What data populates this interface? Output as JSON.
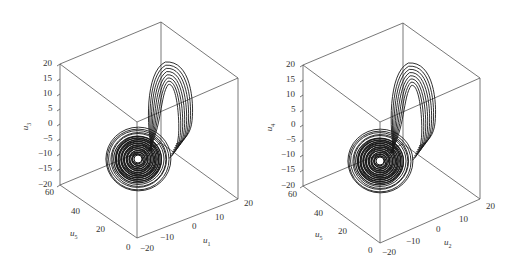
{
  "chart_data": [
    {
      "type": "scatter",
      "subtype": "3d-phase-trajectory",
      "title": "",
      "axes": {
        "x": {
          "label": "u1",
          "ticks": [
            "-20",
            "-10",
            "0",
            "10",
            "20"
          ],
          "range": [
            -20,
            20
          ]
        },
        "y": {
          "label": "u5",
          "ticks": [
            "0",
            "20",
            "40",
            "60"
          ],
          "range": [
            0,
            60
          ]
        },
        "z": {
          "label": "u3",
          "ticks": [
            "-20",
            "-15",
            "-10",
            "-5",
            "0",
            "5",
            "10",
            "15",
            "20"
          ],
          "range": [
            -20,
            20
          ]
        }
      },
      "grid": false,
      "box": true,
      "description": "Chaotic attractor: dense spiral lobe near (u1≈-20 side, u3≈-10) and a loop lobe rising to u3≈15"
    },
    {
      "type": "scatter",
      "subtype": "3d-phase-trajectory",
      "title": "",
      "axes": {
        "x": {
          "label": "u2",
          "ticks": [
            "-20",
            "-10",
            "0",
            "10",
            "20"
          ],
          "range": [
            -20,
            20
          ]
        },
        "y": {
          "label": "u5",
          "ticks": [
            "0",
            "20",
            "40",
            "60"
          ],
          "range": [
            0,
            60
          ]
        },
        "z": {
          "label": "u4",
          "ticks": [
            "-20",
            "-15",
            "-10",
            "-5",
            "0",
            "5",
            "10",
            "15",
            "20"
          ],
          "range": [
            -20,
            20
          ]
        }
      },
      "grid": false,
      "box": true,
      "description": "Chaotic attractor: dense spiral lobe and a loop lobe, similar to left panel"
    }
  ],
  "panels": [
    {
      "z_label_var": "u",
      "z_label_sub": "3",
      "y_label_var": "u",
      "y_label_sub": "5",
      "x_label_var": "u",
      "x_label_sub": "1",
      "z_ticks": [
        "20",
        "15",
        "10",
        "5",
        "0",
        "−5",
        "−10",
        "−15",
        "−20"
      ],
      "y_ticks": [
        "60",
        "40",
        "20",
        "0"
      ],
      "x_ticks": [
        "−20",
        "−10",
        "0",
        "10",
        "20"
      ]
    },
    {
      "z_label_var": "u",
      "z_label_sub": "4",
      "y_label_var": "u",
      "y_label_sub": "5",
      "x_label_var": "u",
      "x_label_sub": "2",
      "z_ticks": [
        "20",
        "15",
        "10",
        "5",
        "0",
        "−5",
        "−10",
        "−15",
        "−20"
      ],
      "y_ticks": [
        "60",
        "40",
        "20",
        "0"
      ],
      "x_ticks": [
        "−20",
        "−10",
        "0",
        "10",
        "20"
      ]
    }
  ],
  "colors": {
    "box": "#555555",
    "trajectory": "#1a1a1a",
    "text": "#333333"
  }
}
